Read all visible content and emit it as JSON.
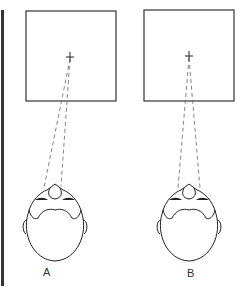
{
  "figure": {
    "panels": [
      {
        "id": "A",
        "label": "A",
        "screen": {
          "x": 26,
          "y": 11,
          "w": 90,
          "h": 90
        },
        "target": {
          "x": 70,
          "y": 57
        },
        "sightlines": [
          {
            "x": 44,
            "y": 188
          },
          {
            "x": 61,
            "y": 186
          }
        ],
        "head_center": {
          "x": 55,
          "y": 224
        }
      },
      {
        "id": "B",
        "label": "B",
        "screen": {
          "x": 144,
          "y": 10,
          "w": 90,
          "h": 91
        },
        "target": {
          "x": 189,
          "y": 56
        },
        "sightlines": [
          {
            "x": 178,
            "y": 188
          },
          {
            "x": 200,
            "y": 188
          }
        ],
        "head_center": {
          "x": 189,
          "y": 224
        }
      }
    ],
    "colors": {
      "line": "#222222",
      "dash": "#666666",
      "border": "#333333"
    }
  }
}
